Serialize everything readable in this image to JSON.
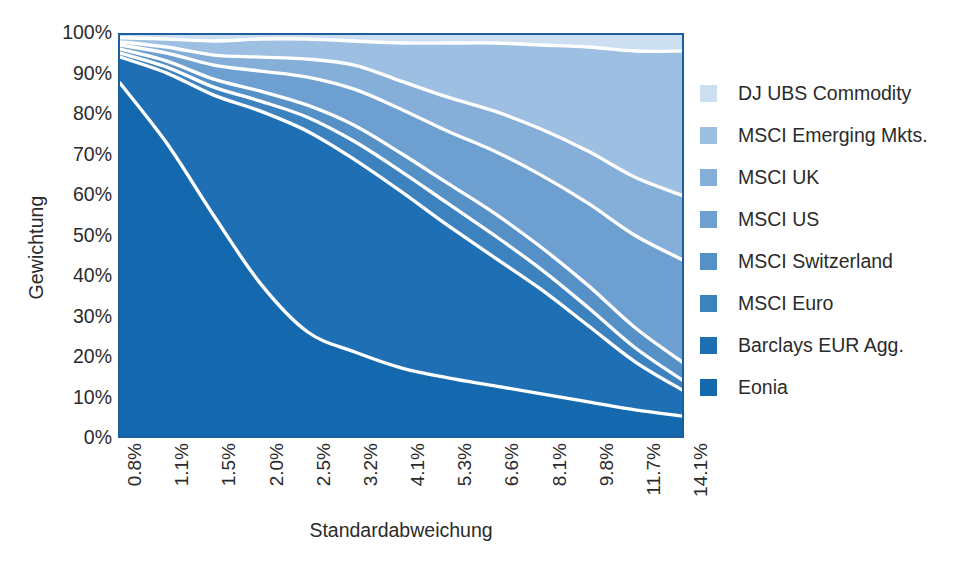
{
  "chart_data": {
    "type": "area",
    "title": "",
    "subtitle": "",
    "xlabel": "Standardabweichung",
    "ylabel": "Gewichtung",
    "stacked": true,
    "normalized_percent": true,
    "grid": false,
    "legend_position": "right",
    "ylim": [
      0,
      100
    ],
    "y_ticks": [
      "0%",
      "10%",
      "20%",
      "30%",
      "40%",
      "50%",
      "60%",
      "70%",
      "80%",
      "90%",
      "100%"
    ],
    "y_tick_values": [
      0,
      10,
      20,
      30,
      40,
      50,
      60,
      70,
      80,
      90,
      100
    ],
    "categories": [
      "0.8%",
      "1.1%",
      "1.5%",
      "2.0%",
      "2.5%",
      "3.2%",
      "4.1%",
      "5.3%",
      "6.6%",
      "8.1%",
      "9.8%",
      "11.7%",
      "14.1%"
    ],
    "x_values": [
      0.8,
      1.1,
      1.5,
      2.0,
      2.5,
      3.2,
      4.1,
      5.3,
      6.6,
      8.1,
      9.8,
      11.7,
      14.1
    ],
    "series": [
      {
        "name": "Eonia",
        "color": "#1368ae",
        "values": [
          88.0,
          73.0,
          55.0,
          38.0,
          26.0,
          21.0,
          17.0,
          14.5,
          12.5,
          10.5,
          8.5,
          6.5,
          5.0
        ]
      },
      {
        "name": "Barclays EUR Agg.",
        "color": "#1f6fb4",
        "values": [
          6.5,
          17.5,
          30.0,
          43.0,
          50.0,
          48.0,
          44.0,
          38.0,
          32.0,
          26.0,
          19.0,
          12.0,
          6.5
        ]
      },
      {
        "name": "MSCI Euro",
        "color": "#3b82bf",
        "values": [
          1.0,
          1.5,
          2.0,
          2.5,
          3.5,
          4.5,
          5.0,
          5.5,
          5.5,
          5.0,
          4.5,
          3.5,
          2.5
        ]
      },
      {
        "name": "MSCI Switzerland",
        "color": "#5590c7",
        "values": [
          1.0,
          1.5,
          2.0,
          2.5,
          3.0,
          4.0,
          4.5,
          5.0,
          5.5,
          5.5,
          5.5,
          5.0,
          4.5
        ]
      },
      {
        "name": "MSCI US",
        "color": "#6d9fd0",
        "values": [
          1.0,
          2.0,
          3.5,
          5.0,
          7.0,
          9.0,
          11.0,
          13.0,
          15.5,
          18.0,
          20.5,
          23.0,
          25.5
        ]
      },
      {
        "name": "MSCI UK",
        "color": "#85aed8",
        "values": [
          0.8,
          1.5,
          2.5,
          3.5,
          4.5,
          6.0,
          7.0,
          8.5,
          10.0,
          11.5,
          13.0,
          14.5,
          16.0
        ]
      },
      {
        "name": "MSCI Emerging Mkts.",
        "color": "#9cbfe2",
        "values": [
          1.0,
          2.0,
          3.5,
          4.5,
          5.0,
          6.0,
          9.5,
          13.5,
          17.0,
          21.0,
          26.0,
          31.5,
          36.0
        ]
      },
      {
        "name": "DJ UBS Commodity",
        "color": "#cbdff0",
        "values": [
          0.7,
          1.0,
          1.5,
          1.0,
          1.0,
          1.5,
          2.0,
          2.0,
          2.0,
          2.5,
          3.0,
          4.0,
          4.0
        ]
      }
    ],
    "boundary_line_color": "#ffffff",
    "plot_border_color": "#1d5f9c"
  },
  "legend": {
    "items": [
      {
        "label": "DJ UBS Commodity",
        "color": "#cbdff0"
      },
      {
        "label": "MSCI Emerging Mkts.",
        "color": "#9cbfe2"
      },
      {
        "label": "MSCI UK",
        "color": "#85aed8"
      },
      {
        "label": "MSCI US",
        "color": "#6d9fd0"
      },
      {
        "label": "MSCI Switzerland",
        "color": "#5590c7"
      },
      {
        "label": "MSCI Euro",
        "color": "#3b82bf"
      },
      {
        "label": "Barclays EUR Agg.",
        "color": "#1f6fb4"
      },
      {
        "label": "Eonia",
        "color": "#1368ae"
      }
    ]
  }
}
